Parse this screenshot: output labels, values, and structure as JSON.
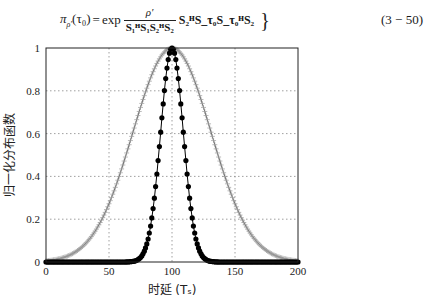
{
  "equation": {
    "lhs": "π",
    "lhs_sub": "ρ′",
    "lhs_arg": "(τ₀)",
    "equals": "=",
    "func": "exp",
    "numerator": "ρ′",
    "denominator": "S₁ᴴS₁S₂ᴴS₂",
    "tail": "S₂ᴴS_τ₀S_τ₀ᴴS₂",
    "closing": "}",
    "number": "(3 − 50)"
  },
  "chart_data": {
    "type": "line",
    "title": "",
    "xlabel": "时延 (Tₛ)",
    "ylabel": "归一化分布函数",
    "xlim": [
      0,
      200
    ],
    "ylim": [
      0,
      1
    ],
    "xticks": [
      0,
      50,
      100,
      150,
      200
    ],
    "yticks": [
      0,
      0.2,
      0.4,
      0.6,
      0.8,
      1
    ],
    "xtick_labels": [
      "0",
      "50",
      "100",
      "150",
      "200"
    ],
    "ytick_labels": [
      "0",
      "0.2",
      "0.4",
      "0.6",
      "0.8",
      "1"
    ],
    "grid": true,
    "grid_style": "dotted",
    "legend": null,
    "series": [
      {
        "name": "wide distribution (plus markers)",
        "marker": "+",
        "color": "#555555",
        "shape": "gaussian",
        "center": 100,
        "sigma": 31,
        "x": [
          0,
          10,
          20,
          30,
          40,
          50,
          60,
          70,
          80,
          90,
          100,
          110,
          120,
          130,
          140,
          150,
          160,
          170,
          180,
          190,
          200
        ],
        "values": [
          0.01,
          0.02,
          0.04,
          0.08,
          0.15,
          0.27,
          0.43,
          0.63,
          0.81,
          0.95,
          1.0,
          0.95,
          0.81,
          0.63,
          0.43,
          0.27,
          0.15,
          0.08,
          0.04,
          0.02,
          0.01
        ]
      },
      {
        "name": "narrow distribution (filled dots)",
        "marker": "●",
        "color": "#000000",
        "shape": "gaussian",
        "center": 100,
        "sigma": 9,
        "x": [
          60,
          70,
          75,
          80,
          85,
          90,
          95,
          100,
          105,
          110,
          115,
          120,
          125,
          130,
          140
        ],
        "values": [
          0.0,
          0.004,
          0.021,
          0.085,
          0.249,
          0.539,
          0.857,
          1.0,
          0.857,
          0.539,
          0.249,
          0.085,
          0.021,
          0.004,
          0.0
        ]
      }
    ]
  }
}
